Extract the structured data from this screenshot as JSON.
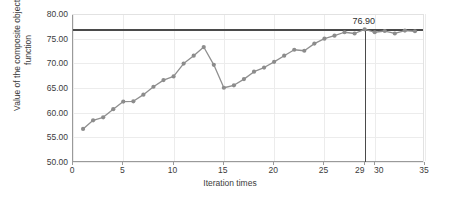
{
  "chart_data": {
    "type": "line",
    "title": "",
    "xlabel": "Iteration times",
    "ylabel": "Value of the composite objective function",
    "xlim": [
      0,
      35
    ],
    "ylim": [
      50,
      80
    ],
    "grid": true,
    "legend": null,
    "x": [
      1,
      2,
      3,
      4,
      5,
      6,
      7,
      8,
      9,
      10,
      11,
      12,
      13,
      14,
      15,
      16,
      17,
      18,
      19,
      20,
      21,
      22,
      23,
      24,
      25,
      26,
      27,
      28,
      29,
      30,
      31,
      32,
      33,
      34
    ],
    "values": [
      56.7,
      58.45,
      59.05,
      60.7,
      62.25,
      62.3,
      63.65,
      65.25,
      66.6,
      67.35,
      69.95,
      71.55,
      73.3,
      69.7,
      65.05,
      65.55,
      66.8,
      68.3,
      69.15,
      70.3,
      71.55,
      72.75,
      72.55,
      74.0,
      75.0,
      75.6,
      76.3,
      76.05,
      76.9,
      76.3,
      76.55,
      76.05,
      76.65,
      76.5
    ],
    "series": [
      {
        "name": "composite objective value",
        "values": [
          56.7,
          58.45,
          59.05,
          60.7,
          62.25,
          62.3,
          63.65,
          65.25,
          66.6,
          67.35,
          69.95,
          71.55,
          73.3,
          69.7,
          65.05,
          65.55,
          66.8,
          68.3,
          69.15,
          70.3,
          71.55,
          72.75,
          72.55,
          74.0,
          75.0,
          75.6,
          76.3,
          76.05,
          76.9,
          76.3,
          76.55,
          76.05,
          76.65,
          76.5
        ]
      }
    ],
    "yticks": [
      "50.00",
      "55.00",
      "60.00",
      "65.00",
      "70.00",
      "75.00",
      "80.00"
    ],
    "ytick_values": [
      50,
      55,
      60,
      65,
      70,
      75,
      80
    ],
    "xticks": [
      "0",
      "5",
      "10",
      "15",
      "20",
      "25",
      "29",
      "30",
      "35"
    ],
    "xtick_values": [
      0,
      5,
      10,
      15,
      20,
      25,
      29,
      30,
      35
    ],
    "annotations": [
      {
        "label": "76.90",
        "x": 29,
        "y": 76.9
      }
    ],
    "reference_line": {
      "y": 76.9,
      "color": "#4a4a4a"
    },
    "marker_line": {
      "x": 29,
      "color": "#4a4a4a"
    },
    "colors": {
      "line": "#8f8f8f",
      "marker": "#8c8c8c",
      "grid": "#ececec",
      "axis": "#9a9a9a",
      "text": "#3b3b3b",
      "background": "#ffffff"
    }
  }
}
